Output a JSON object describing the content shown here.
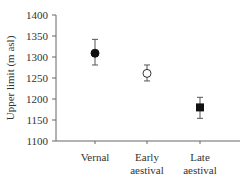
{
  "chart_data": {
    "type": "scatter",
    "title": "",
    "xlabel": "",
    "ylabel": "Upper limit (m asl)",
    "ylim": [
      1100,
      1400
    ],
    "yticks": [
      1100,
      1150,
      1200,
      1250,
      1300,
      1350,
      1400
    ],
    "grid": false,
    "legend": "none",
    "categories": [
      [
        "Vernal"
      ],
      [
        "Early",
        "aestival"
      ],
      [
        "Late",
        "aestival"
      ]
    ],
    "points": [
      {
        "category": "Vernal",
        "value": 1309,
        "err_low": 1281,
        "err_high": 1342,
        "marker": "filled-circle"
      },
      {
        "category": "Early aestival",
        "value": 1261,
        "err_low": 1243,
        "err_high": 1281,
        "marker": "open-circle"
      },
      {
        "category": "Late aestival",
        "value": 1180,
        "err_low": 1154,
        "err_high": 1204,
        "marker": "filled-square"
      }
    ]
  }
}
